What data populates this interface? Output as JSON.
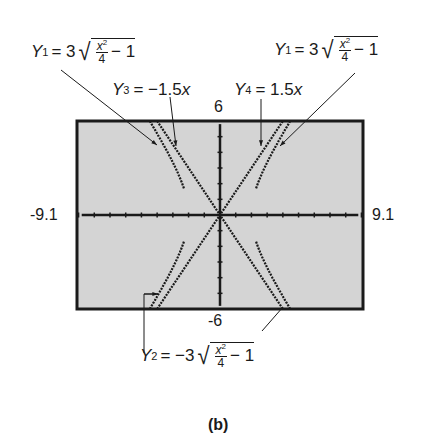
{
  "figure": {
    "caption": "(b)",
    "window": {
      "xmin": "-9.1",
      "xmax": "9.1",
      "ymin": "-6",
      "ymax": "6"
    },
    "labels": {
      "y1_left": {
        "name": "Y",
        "sub": "1",
        "rhs_coef": "= 3",
        "num": "x",
        "num_exp": "2",
        "den": "4",
        "tail": "− 1"
      },
      "y1_right": {
        "name": "Y",
        "sub": "1",
        "rhs_coef": "= 3",
        "num": "x",
        "num_exp": "2",
        "den": "4",
        "tail": "− 1"
      },
      "y3": {
        "name": "Y",
        "sub": "3",
        "rhs": "= −1.5",
        "var": "x"
      },
      "y4": {
        "name": "Y",
        "sub": "4",
        "rhs": "= 1.5",
        "var": "x"
      },
      "y2": {
        "name": "Y",
        "sub": "2",
        "rhs_coef": "= −3",
        "num": "x",
        "num_exp": "2",
        "den": "4",
        "tail": "− 1"
      }
    },
    "colors": {
      "screen": "#d4d4d4",
      "ink": "#1a1a1a",
      "background": "#ffffff"
    }
  },
  "chart_data": {
    "type": "line",
    "title": "",
    "xlabel": "",
    "ylabel": "",
    "xlim": [
      -9.1,
      9.1
    ],
    "ylim": [
      -6,
      6
    ],
    "series": [
      {
        "name": "Y1 = 3√(x²/4 − 1)",
        "domain": "|x| ≥ 2",
        "x": [
          2,
          2.5,
          3,
          4,
          5,
          6
        ],
        "values": [
          0,
          2.25,
          3.35,
          5.2,
          6.87,
          8.49
        ]
      },
      {
        "name": "Y2 = −3√(x²/4 − 1)",
        "domain": "|x| ≥ 2",
        "x": [
          2,
          2.5,
          3,
          4,
          5,
          6
        ],
        "values": [
          0,
          -2.25,
          -3.35,
          -5.2,
          -6.87,
          -8.49
        ]
      },
      {
        "name": "Y3 = −1.5x",
        "x": [
          -4,
          0,
          4
        ],
        "values": [
          6,
          0,
          -6
        ]
      },
      {
        "name": "Y4 = 1.5x",
        "x": [
          -4,
          0,
          4
        ],
        "values": [
          -6,
          0,
          6
        ]
      }
    ]
  }
}
